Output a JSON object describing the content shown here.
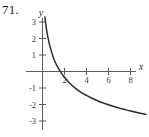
{
  "figure": {
    "problem_number": "71."
  },
  "chart_data": {
    "type": "line",
    "title": "",
    "xlabel": "x",
    "ylabel": "y",
    "xlim": [
      -0.6,
      9.6
    ],
    "ylim": [
      -3.6,
      3.6
    ],
    "grid": false,
    "legend": null,
    "x_ticks": [
      2,
      4,
      6,
      8
    ],
    "x_tick_labels": [
      "2",
      "4",
      "6",
      "8"
    ],
    "y_ticks": [
      3,
      2,
      1,
      -1,
      -2,
      -3
    ],
    "y_tick_labels": [
      "3",
      "2",
      "1",
      "-1",
      "-2",
      "-3"
    ],
    "series": [
      {
        "name": "curve",
        "description": "decreasing logarithmic curve with vertical asymptote at x = 0",
        "x": [
          0.22,
          0.3,
          0.4,
          0.5,
          0.65,
          0.8,
          1.0,
          1.2,
          1.4,
          1.7,
          2.0,
          2.5,
          3.0,
          3.5,
          4.0,
          4.5,
          5.0,
          5.5,
          6.0,
          6.5,
          7.0,
          7.5,
          8.0,
          8.5,
          9.0,
          9.4
        ],
        "y": [
          3.3,
          2.85,
          2.4,
          2.05,
          1.6,
          1.25,
          0.82,
          0.5,
          0.25,
          -0.08,
          -0.35,
          -0.73,
          -1.02,
          -1.26,
          -1.45,
          -1.62,
          -1.77,
          -1.9,
          -2.02,
          -2.12,
          -2.22,
          -2.31,
          -2.4,
          -2.47,
          -2.55,
          -2.6
        ]
      }
    ],
    "axis_label_x": "x",
    "axis_label_y": "y"
  }
}
